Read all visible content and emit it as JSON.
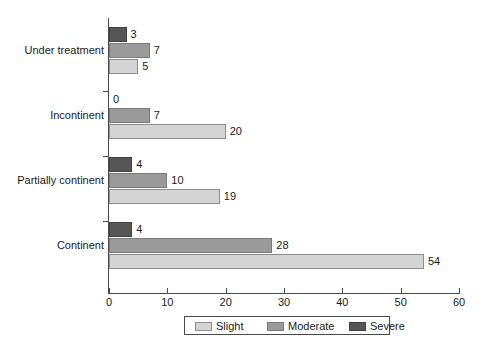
{
  "chart_data": {
    "type": "bar",
    "orientation": "horizontal",
    "title": "",
    "xlabel": "",
    "ylabel": "",
    "xlim": [
      0,
      60
    ],
    "xticks": [
      0,
      10,
      20,
      30,
      40,
      50,
      60
    ],
    "grid": false,
    "legend_position": "bottom",
    "categories": [
      "Under treatment",
      "Incontinent",
      "Partially continent",
      "Continent"
    ],
    "series": [
      {
        "name": "Slight",
        "color": "#d4d4d4",
        "values": [
          5,
          20,
          19,
          54
        ]
      },
      {
        "name": "Moderate",
        "color": "#9a9a9a",
        "values": [
          7,
          7,
          10,
          28
        ]
      },
      {
        "name": "Severe",
        "color": "#565656",
        "values": [
          3,
          0,
          4,
          4
        ]
      }
    ],
    "data_labels": {
      "Under treatment": {
        "Severe": "3",
        "Moderate": "7",
        "Slight": "5"
      },
      "Incontinent": {
        "Severe": "0",
        "Moderate": "7",
        "Slight": "20"
      },
      "Partially continent": {
        "Severe": "4",
        "Moderate": "10",
        "Slight": "19"
      },
      "Continent": {
        "Severe": "4",
        "Moderate": "28",
        "Slight": "54"
      }
    }
  },
  "axis": {
    "tick_labels": [
      "0",
      "10",
      "20",
      "30",
      "40",
      "50",
      "60"
    ]
  },
  "legend": {
    "entries": [
      {
        "label": "Slight",
        "swatch": "slight"
      },
      {
        "label": "Moderate",
        "swatch": "moderate"
      },
      {
        "label": "Severe",
        "swatch": "severe"
      }
    ]
  }
}
